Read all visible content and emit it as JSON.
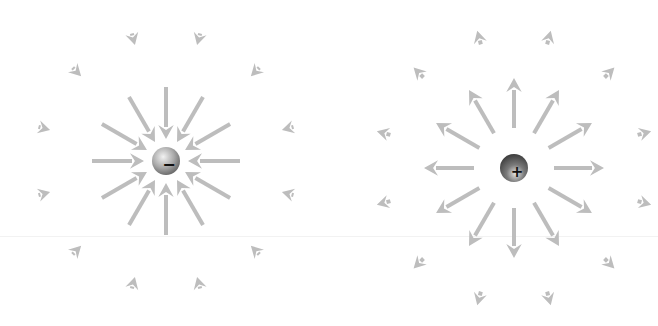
{
  "diagram": {
    "title": "",
    "arrow_color": "#bdbdbd",
    "charges": [
      {
        "id": "negative",
        "sign": "-",
        "label": "−",
        "center": [
          166,
          161
        ],
        "radius": 14,
        "field_direction": "inward",
        "inner_ring": {
          "count": 12,
          "start_angle_deg": 0,
          "r_outer": 74,
          "r_inner": 22
        },
        "outer_ring": {
          "count": 12,
          "start_angle_deg": 15,
          "r_outer": 132,
          "r_inner": 120
        }
      },
      {
        "id": "positive",
        "sign": "+",
        "label": "+",
        "center": [
          514,
          168
        ],
        "radius": 14,
        "field_direction": "outward",
        "inner_ring": {
          "count": 12,
          "start_angle_deg": 0,
          "r_inner": 40,
          "r_outer": 90
        },
        "outer_ring": {
          "count": 12,
          "start_angle_deg": 15,
          "r_inner": 128,
          "r_outer": 142
        }
      }
    ]
  }
}
